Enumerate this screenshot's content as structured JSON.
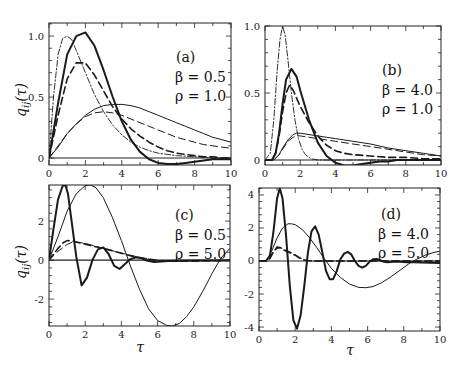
{
  "figure": {
    "ylabel": "q_ij(τ)",
    "xlabel": "τ"
  },
  "chart_data": [
    {
      "type": "line",
      "panel": "(a)",
      "annotation": [
        "(a)",
        "β = 0.5",
        "ρ = 1.0"
      ],
      "xlabel": "",
      "ylabel": "q_ij(τ)",
      "xlim": [
        0,
        10
      ],
      "ylim": [
        -0.057,
        1.107
      ],
      "xticks": [
        0,
        2,
        4,
        6,
        8,
        10
      ],
      "yticks": [
        0,
        0.5,
        1.0
      ],
      "ytick_labels": [
        "0",
        "0.5",
        "1.0"
      ],
      "grid": false,
      "series": [
        {
          "name": "thick solid",
          "style": "solid",
          "width": 2.0,
          "x": [
            0,
            0.5,
            1,
            1.5,
            2,
            2.5,
            3,
            3.5,
            4,
            4.5,
            5,
            5.5,
            6,
            6.5,
            7,
            7.5,
            8,
            8.5,
            9,
            9.5,
            10
          ],
          "y": [
            0,
            0.45,
            0.85,
            1.0,
            1.03,
            0.92,
            0.72,
            0.5,
            0.3,
            0.15,
            0.05,
            -0.01,
            -0.04,
            -0.05,
            -0.05,
            -0.04,
            -0.03,
            -0.02,
            -0.01,
            -0.01,
            -0.01
          ]
        },
        {
          "name": "thick dashed",
          "style": "dashed",
          "width": 1.6,
          "x": [
            0,
            0.5,
            1,
            1.5,
            2,
            2.5,
            3,
            3.5,
            4,
            4.5,
            5,
            5.5,
            6,
            6.5,
            7,
            7.5,
            8,
            8.5,
            9,
            9.5,
            10
          ],
          "y": [
            0,
            0.35,
            0.65,
            0.78,
            0.78,
            0.68,
            0.55,
            0.42,
            0.32,
            0.24,
            0.18,
            0.13,
            0.09,
            0.06,
            0.04,
            0.03,
            0.02,
            0.01,
            0.01,
            0.0,
            0.0
          ]
        },
        {
          "name": "thin solid",
          "style": "solid",
          "width": 1.0,
          "x": [
            0,
            0.5,
            1,
            1.5,
            2,
            2.5,
            3,
            3.5,
            4,
            4.5,
            5,
            5.5,
            6,
            6.5,
            7,
            7.5,
            8,
            8.5,
            9,
            9.5,
            10
          ],
          "y": [
            0,
            0.09,
            0.2,
            0.28,
            0.35,
            0.4,
            0.43,
            0.44,
            0.44,
            0.43,
            0.41,
            0.38,
            0.35,
            0.32,
            0.29,
            0.26,
            0.23,
            0.2,
            0.17,
            0.15,
            0.13
          ]
        },
        {
          "name": "thin dashed",
          "style": "dashed",
          "width": 1.0,
          "x": [
            0,
            0.5,
            1,
            1.5,
            2,
            2.5,
            3,
            3.5,
            4,
            4.5,
            5,
            5.5,
            6,
            6.5,
            7,
            7.5,
            8,
            8.5,
            9,
            9.5,
            10
          ],
          "y": [
            0,
            0.1,
            0.2,
            0.28,
            0.34,
            0.37,
            0.38,
            0.37,
            0.35,
            0.32,
            0.29,
            0.26,
            0.23,
            0.2,
            0.17,
            0.15,
            0.13,
            0.11,
            0.1,
            0.09,
            0.08
          ]
        },
        {
          "name": "dash-dot",
          "style": "dashdot",
          "width": 0.9,
          "x": [
            0,
            0.25,
            0.5,
            0.75,
            1,
            1.25,
            1.5,
            2,
            2.5,
            3,
            3.5,
            4,
            4.5,
            5,
            5.5,
            6,
            7,
            8,
            9,
            10
          ],
          "y": [
            0,
            0.5,
            0.85,
            0.98,
            1.0,
            0.97,
            0.88,
            0.7,
            0.52,
            0.38,
            0.27,
            0.19,
            0.13,
            0.09,
            0.06,
            0.04,
            0.02,
            0.01,
            0.0,
            0.0
          ]
        }
      ]
    },
    {
      "type": "line",
      "panel": "(b)",
      "annotation": [
        "(b)",
        "β = 4.0",
        "ρ = 1.0"
      ],
      "xlabel": "",
      "ylabel": "",
      "xlim": [
        0,
        10
      ],
      "ylim": [
        -0.037,
        1.0
      ],
      "xticks": [
        0,
        2,
        4,
        6,
        8,
        10
      ],
      "yticks": [
        0,
        0.5,
        1.0
      ],
      "ytick_labels": [
        "0",
        "0.5",
        "1.0"
      ],
      "grid": false,
      "series": [
        {
          "name": "thick solid",
          "style": "solid",
          "width": 2.0,
          "x": [
            0,
            0.4,
            0.6,
            0.8,
            1,
            1.2,
            1.5,
            1.8,
            2,
            2.5,
            3,
            3.5,
            4,
            4.5,
            5,
            5.5,
            6,
            6.5,
            7,
            7.5,
            8,
            9,
            10
          ],
          "y": [
            0,
            0.0,
            0.05,
            0.2,
            0.42,
            0.6,
            0.68,
            0.62,
            0.52,
            0.3,
            0.13,
            0.03,
            -0.02,
            -0.04,
            -0.04,
            -0.03,
            -0.02,
            -0.01,
            -0.01,
            0.0,
            0.0,
            0.0,
            0.0
          ]
        },
        {
          "name": "thick dashed",
          "style": "dashed",
          "width": 1.6,
          "x": [
            0,
            0.4,
            0.6,
            0.8,
            1,
            1.2,
            1.4,
            1.6,
            1.8,
            2,
            2.5,
            3,
            3.5,
            4,
            4.5,
            5,
            6,
            7,
            8,
            9,
            10
          ],
          "y": [
            0,
            0.0,
            0.05,
            0.18,
            0.36,
            0.5,
            0.56,
            0.52,
            0.46,
            0.4,
            0.28,
            0.18,
            0.11,
            0.07,
            0.05,
            0.04,
            0.03,
            0.02,
            0.02,
            0.01,
            0.01
          ]
        },
        {
          "name": "thin solid",
          "style": "solid",
          "width": 1.0,
          "x": [
            0,
            0.5,
            0.8,
            1,
            1.3,
            1.6,
            1.8,
            2,
            2.5,
            3,
            3.5,
            4,
            5,
            6,
            7,
            8,
            9,
            10
          ],
          "y": [
            0,
            0.0,
            0.04,
            0.09,
            0.15,
            0.19,
            0.2,
            0.2,
            0.19,
            0.18,
            0.17,
            0.16,
            0.14,
            0.12,
            0.09,
            0.07,
            0.05,
            0.03
          ]
        },
        {
          "name": "thin dashed",
          "style": "dashed",
          "width": 1.0,
          "x": [
            0,
            0.5,
            0.8,
            1,
            1.3,
            1.6,
            1.8,
            2,
            2.5,
            3,
            3.5,
            4,
            5,
            6,
            7,
            8,
            9,
            10
          ],
          "y": [
            0,
            0.0,
            0.04,
            0.08,
            0.14,
            0.17,
            0.18,
            0.18,
            0.17,
            0.16,
            0.15,
            0.14,
            0.12,
            0.1,
            0.08,
            0.06,
            0.04,
            0.03
          ]
        },
        {
          "name": "dash-dot",
          "style": "dashdot",
          "width": 0.9,
          "x": [
            0,
            0.3,
            0.5,
            0.7,
            0.85,
            1,
            1.15,
            1.3,
            1.5,
            1.7,
            1.9,
            2.1,
            2.3,
            2.6,
            3,
            3.5,
            4,
            5,
            10
          ],
          "y": [
            0,
            0.05,
            0.3,
            0.68,
            0.9,
            1.0,
            0.93,
            0.75,
            0.5,
            0.3,
            0.16,
            0.08,
            0.04,
            0.01,
            0.0,
            0.0,
            0.0,
            0.0,
            0.0
          ]
        }
      ]
    },
    {
      "type": "line",
      "panel": "(c)",
      "annotation": [
        "(c)",
        "β = 0.5",
        "ρ = 5.0"
      ],
      "xlabel": "τ",
      "ylabel": "q_ij(τ)",
      "xlim": [
        0,
        10
      ],
      "ylim": [
        -3.38,
        3.85
      ],
      "xticks": [
        0,
        2,
        4,
        6,
        8,
        10
      ],
      "yticks": [
        -2,
        0,
        2
      ],
      "ytick_labels": [
        "-2",
        "0",
        "2"
      ],
      "grid": false,
      "series": [
        {
          "name": "thick solid",
          "style": "solid",
          "width": 2.0,
          "x": [
            0,
            0.25,
            0.5,
            0.75,
            0.9,
            1.05,
            1.25,
            1.5,
            1.8,
            2.1,
            2.4,
            2.7,
            3.0,
            3.3,
            3.6,
            3.9,
            4.2,
            4.5,
            4.8,
            5.1,
            5.4,
            5.8,
            6.2,
            6.6,
            7,
            8,
            9,
            10
          ],
          "y": [
            0,
            1.6,
            3.1,
            3.8,
            3.85,
            3.4,
            2.0,
            0.2,
            -1.3,
            -0.9,
            0.0,
            0.55,
            0.65,
            0.3,
            -0.3,
            -0.45,
            -0.2,
            0.05,
            0.15,
            0.1,
            -0.02,
            -0.1,
            -0.08,
            -0.05,
            -0.03,
            -0.02,
            -0.02,
            -0.02
          ]
        },
        {
          "name": "thick dashed",
          "style": "dashed",
          "width": 1.6,
          "x": [
            0,
            0.5,
            0.8,
            1.0,
            1.3,
            1.6,
            2,
            2.5,
            3,
            3.5,
            4,
            4.5,
            5,
            5.5,
            6,
            7,
            8,
            9,
            10
          ],
          "y": [
            0,
            0.6,
            0.9,
            1.0,
            0.98,
            0.9,
            0.82,
            0.7,
            0.6,
            0.48,
            0.35,
            0.22,
            0.12,
            0.04,
            -0.03,
            -0.06,
            -0.05,
            -0.03,
            -0.02
          ]
        },
        {
          "name": "thin solid",
          "style": "solid",
          "width": 1.0,
          "x": [
            0,
            0.5,
            1,
            1.5,
            2,
            2.3,
            2.6,
            3,
            3.5,
            4,
            4.5,
            5,
            5.5,
            6,
            6.5,
            6.8,
            7.2,
            7.6,
            8,
            8.5,
            9,
            9.5,
            10
          ],
          "y": [
            0,
            1.2,
            2.5,
            3.4,
            3.82,
            3.85,
            3.7,
            3.2,
            2.2,
            1.0,
            -0.3,
            -1.5,
            -2.5,
            -3.1,
            -3.35,
            -3.38,
            -3.25,
            -2.9,
            -2.4,
            -1.6,
            -0.7,
            0.1,
            0.6
          ]
        },
        {
          "name": "thin dashed",
          "style": "dashed",
          "width": 1.0,
          "x": [
            0,
            0.5,
            1,
            1.3,
            1.6,
            2,
            2.5,
            3,
            3.5,
            4,
            4.5,
            5,
            6,
            7,
            8,
            9,
            10
          ],
          "y": [
            0,
            0.45,
            0.8,
            0.92,
            0.92,
            0.85,
            0.73,
            0.6,
            0.48,
            0.36,
            0.25,
            0.14,
            0.0,
            -0.05,
            -0.04,
            -0.03,
            -0.02
          ]
        }
      ]
    },
    {
      "type": "line",
      "panel": "(d)",
      "annotation": [
        "(d)",
        "β = 4.0",
        "ρ = 5.0"
      ],
      "xlabel": "τ",
      "ylabel": "",
      "xlim": [
        0,
        10
      ],
      "ylim": [
        -4.24,
        4.42
      ],
      "xticks": [
        0,
        2,
        4,
        6,
        8,
        10
      ],
      "yticks": [
        -4,
        -2,
        0,
        2,
        4
      ],
      "ytick_labels": [
        "-4",
        "-2",
        "0",
        "2",
        "4"
      ],
      "grid": false,
      "series": [
        {
          "name": "thick solid",
          "style": "solid",
          "width": 2.0,
          "x": [
            0,
            0.4,
            0.6,
            0.8,
            1.0,
            1.15,
            1.3,
            1.5,
            1.7,
            1.9,
            2.1,
            2.3,
            2.5,
            2.7,
            2.9,
            3.1,
            3.3,
            3.5,
            3.7,
            3.9,
            4.1,
            4.3,
            4.5,
            4.7,
            4.9,
            5.1,
            5.3,
            5.5,
            5.7,
            5.9,
            6.1,
            6.3,
            6.5,
            6.7,
            6.9,
            7.1,
            7.3,
            7.5,
            7.8,
            8.2,
            8.6,
            9,
            10
          ],
          "y": [
            0,
            0.02,
            0.3,
            1.8,
            3.8,
            4.4,
            3.8,
            1.5,
            -1.5,
            -3.6,
            -4.1,
            -3.3,
            -1.5,
            0.5,
            1.8,
            2.1,
            1.6,
            0.5,
            -0.6,
            -1.1,
            -1.1,
            -0.6,
            0.1,
            0.45,
            0.55,
            0.4,
            0.0,
            -0.3,
            -0.4,
            -0.3,
            -0.05,
            0.1,
            0.12,
            0.05,
            -0.05,
            -0.08,
            -0.06,
            -0.04,
            -0.05,
            -0.08,
            -0.08,
            -0.1,
            -0.12
          ]
        },
        {
          "name": "thick dashed",
          "style": "dashed",
          "width": 1.6,
          "x": [
            0,
            0.4,
            0.6,
            0.8,
            1.0,
            1.2,
            1.4,
            1.6,
            1.8,
            2.0,
            2.2,
            2.4,
            2.6,
            3,
            4,
            5,
            6,
            8,
            10
          ],
          "y": [
            0,
            0.0,
            0.15,
            0.55,
            0.85,
            0.8,
            0.65,
            0.55,
            0.45,
            0.35,
            0.2,
            0.1,
            0.03,
            0.0,
            0.0,
            0.0,
            0.0,
            0.0,
            0.0
          ]
        },
        {
          "name": "thin solid",
          "style": "solid",
          "width": 1.0,
          "x": [
            0,
            0.4,
            0.7,
            1,
            1.3,
            1.6,
            1.8,
            2.0,
            2.4,
            2.8,
            3.2,
            3.6,
            4,
            4.5,
            5,
            5.5,
            5.9,
            6.3,
            6.8,
            7.3,
            7.8,
            8.3,
            8.7,
            9.2,
            9.6,
            10
          ],
          "y": [
            0,
            0.02,
            0.6,
            1.4,
            2.0,
            2.25,
            2.25,
            2.2,
            1.9,
            1.4,
            0.8,
            0.15,
            -0.45,
            -1.0,
            -1.4,
            -1.6,
            -1.62,
            -1.55,
            -1.3,
            -0.95,
            -0.55,
            -0.15,
            0.1,
            0.35,
            0.5,
            0.6
          ]
        },
        {
          "name": "thin dashed",
          "style": "dashed",
          "width": 1.0,
          "x": [
            0,
            0.4,
            0.6,
            0.8,
            1.0,
            1.2,
            1.4,
            1.6,
            1.8,
            2.0,
            2.2,
            2.4,
            2.6,
            3,
            4,
            6,
            10
          ],
          "y": [
            0,
            0.0,
            0.2,
            0.6,
            0.75,
            0.8,
            0.7,
            0.6,
            0.5,
            0.38,
            0.25,
            0.12,
            0.04,
            0.0,
            0.0,
            0.0,
            0.0
          ]
        }
      ]
    }
  ],
  "panels": [
    {
      "annotation": {
        "label": "(a)",
        "beta": "β = 0.5",
        "rho": "ρ = 1.0"
      }
    },
    {
      "annotation": {
        "label": "(b)",
        "beta": "β = 4.0",
        "rho": "ρ = 1.0"
      }
    },
    {
      "annotation": {
        "label": "(c)",
        "beta": "β = 0.5",
        "rho": "ρ = 5.0"
      }
    },
    {
      "annotation": {
        "label": "(d)",
        "beta": "β = 4.0",
        "rho": "ρ = 5.0"
      }
    }
  ]
}
